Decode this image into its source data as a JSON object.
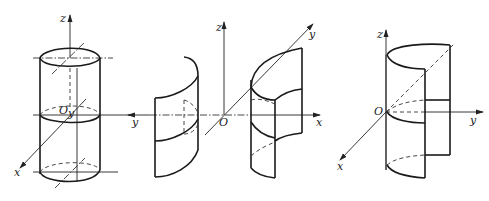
{
  "figures": [
    {
      "id": "cylinder",
      "axes": {
        "z": "z",
        "y": "y",
        "x": "x",
        "origin": "O"
      }
    },
    {
      "id": "hyperbolic-cylinder",
      "axes": {
        "z": "z",
        "y_left": "y",
        "y_diag": "y",
        "x": "x",
        "origin": "O"
      }
    },
    {
      "id": "parabolic-cylinder",
      "axes": {
        "z": "z",
        "y": "y",
        "x": "x",
        "origin": "O"
      }
    }
  ],
  "colors": {
    "stroke": "#1a1a1a",
    "background": "#ffffff"
  }
}
